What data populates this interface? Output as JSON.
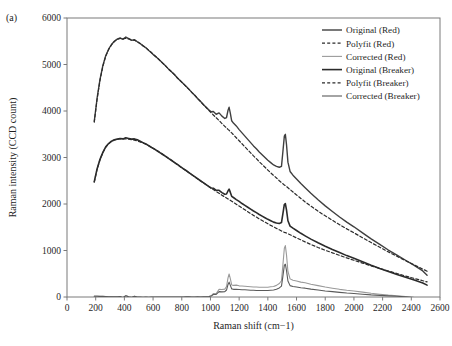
{
  "panel": {
    "label": "(a)"
  },
  "chart_data": {
    "type": "line",
    "title": "",
    "xlabel": "Raman shift (cm−1)",
    "ylabel": "Raman intensity (CCD count)",
    "xlim": [
      0,
      2600
    ],
    "ylim": [
      0,
      6000
    ],
    "xticks": [
      0,
      200,
      400,
      600,
      800,
      1000,
      1200,
      1400,
      1600,
      1800,
      2000,
      2200,
      2400,
      2600
    ],
    "yticks": [
      0,
      1000,
      2000,
      3000,
      4000,
      5000,
      6000
    ],
    "grid": false,
    "legend_position": "top-right",
    "legend": [
      {
        "label": "Original (Red)",
        "style": "solid",
        "color": "#3f3f3f",
        "width": 1.4
      },
      {
        "label": "Polyfit (Red)",
        "style": "dashed",
        "color": "#2b2b2b",
        "width": 1.2
      },
      {
        "label": "Corrected (Red)",
        "style": "solid",
        "color": "#9a9a9a",
        "width": 1.1
      },
      {
        "label": "Original (Breaker)",
        "style": "solid",
        "color": "#2b2b2b",
        "width": 1.6
      },
      {
        "label": "Polyfit (Breaker)",
        "style": "dashed",
        "color": "#2b2b2b",
        "width": 1.2
      },
      {
        "label": "Corrected (Breaker)",
        "style": "solid",
        "color": "#5a5a5a",
        "width": 1.1
      }
    ],
    "x": [
      190,
      210,
      230,
      250,
      270,
      290,
      310,
      330,
      350,
      370,
      390,
      410,
      430,
      450,
      470,
      490,
      510,
      530,
      550,
      570,
      590,
      610,
      630,
      650,
      670,
      690,
      710,
      730,
      750,
      770,
      790,
      810,
      830,
      850,
      870,
      890,
      910,
      930,
      950,
      970,
      990,
      1005,
      1020,
      1040,
      1060,
      1080,
      1100,
      1112,
      1122,
      1130,
      1138,
      1148,
      1160,
      1180,
      1200,
      1220,
      1240,
      1260,
      1280,
      1300,
      1320,
      1340,
      1360,
      1380,
      1400,
      1420,
      1440,
      1460,
      1480,
      1495,
      1505,
      1515,
      1522,
      1530,
      1540,
      1555,
      1575,
      1600,
      1630,
      1660,
      1700,
      1750,
      1800,
      1850,
      1900,
      1950,
      2000,
      2060,
      2120,
      2180,
      2240,
      2300,
      2360,
      2420,
      2480,
      2510
    ],
    "series": [
      {
        "name": "Original (Red)",
        "values": [
          3780,
          4280,
          4680,
          4980,
          5190,
          5330,
          5430,
          5500,
          5545,
          5570,
          5540,
          5590,
          5555,
          5520,
          5535,
          5490,
          5450,
          5400,
          5360,
          5300,
          5250,
          5190,
          5140,
          5080,
          5020,
          4960,
          4895,
          4840,
          4780,
          4710,
          4650,
          4590,
          4530,
          4470,
          4400,
          4340,
          4270,
          4210,
          4140,
          4080,
          4020,
          3985,
          3990,
          3930,
          3960,
          3890,
          3840,
          3860,
          4010,
          4080,
          3960,
          3790,
          3740,
          3680,
          3600,
          3530,
          3460,
          3390,
          3320,
          3250,
          3190,
          3120,
          3060,
          3000,
          2940,
          2890,
          2840,
          2810,
          2790,
          2810,
          3130,
          3460,
          3500,
          3280,
          2900,
          2700,
          2620,
          2540,
          2440,
          2350,
          2230,
          2090,
          1960,
          1840,
          1720,
          1610,
          1510,
          1380,
          1250,
          1130,
          1010,
          900,
          790,
          680,
          560,
          470
        ]
      },
      {
        "name": "Polyfit (Red)",
        "values": [
          3760,
          4260,
          4660,
          4960,
          5180,
          5320,
          5420,
          5495,
          5540,
          5560,
          5555,
          5560,
          5550,
          5530,
          5520,
          5490,
          5450,
          5405,
          5360,
          5305,
          5250,
          5195,
          5140,
          5080,
          5020,
          4960,
          4895,
          4840,
          4780,
          4710,
          4650,
          4590,
          4525,
          4465,
          4400,
          4340,
          4270,
          4205,
          4140,
          4075,
          4010,
          3960,
          3915,
          3855,
          3795,
          3730,
          3670,
          3635,
          3605,
          3585,
          3560,
          3530,
          3490,
          3425,
          3360,
          3295,
          3230,
          3165,
          3100,
          3035,
          2975,
          2910,
          2850,
          2790,
          2730,
          2670,
          2615,
          2560,
          2500,
          2460,
          2435,
          2410,
          2395,
          2375,
          2350,
          2310,
          2260,
          2195,
          2120,
          2045,
          1955,
          1845,
          1745,
          1650,
          1555,
          1465,
          1380,
          1275,
          1170,
          1070,
          970,
          875,
          780,
          690,
          600,
          555
        ]
      },
      {
        "name": "Corrected (Red)",
        "values": [
          20,
          20,
          20,
          20,
          10,
          10,
          10,
          5,
          5,
          10,
          -15,
          30,
          5,
          -10,
          15,
          0,
          0,
          -5,
          0,
          -5,
          0,
          -5,
          0,
          0,
          0,
          0,
          0,
          0,
          0,
          0,
          0,
          0,
          5,
          5,
          0,
          0,
          0,
          5,
          0,
          5,
          10,
          25,
          75,
          75,
          165,
          160,
          170,
          225,
          405,
          495,
          400,
          260,
          250,
          255,
          240,
          235,
          230,
          225,
          220,
          215,
          215,
          210,
          210,
          210,
          210,
          220,
          225,
          250,
          290,
          350,
          695,
          1050,
          1105,
          905,
          550,
          390,
          360,
          345,
          320,
          305,
          275,
          245,
          215,
          190,
          165,
          145,
          130,
          105,
          80,
          60,
          40,
          25,
          10,
          -10,
          -40,
          -85
        ]
      },
      {
        "name": "Original (Breaker)",
        "values": [
          2480,
          2760,
          2960,
          3110,
          3230,
          3300,
          3350,
          3380,
          3395,
          3410,
          3400,
          3425,
          3410,
          3395,
          3400,
          3380,
          3350,
          3320,
          3290,
          3255,
          3215,
          3180,
          3140,
          3100,
          3060,
          3020,
          2975,
          2935,
          2890,
          2850,
          2805,
          2760,
          2720,
          2675,
          2630,
          2590,
          2545,
          2500,
          2460,
          2415,
          2375,
          2345,
          2340,
          2295,
          2295,
          2245,
          2210,
          2215,
          2280,
          2320,
          2255,
          2165,
          2140,
          2095,
          2055,
          2010,
          1970,
          1930,
          1890,
          1850,
          1815,
          1775,
          1740,
          1705,
          1670,
          1640,
          1610,
          1590,
          1580,
          1600,
          1795,
          1990,
          2010,
          1875,
          1640,
          1525,
          1480,
          1430,
          1370,
          1315,
          1245,
          1165,
          1090,
          1020,
          955,
          890,
          835,
          760,
          685,
          615,
          550,
          485,
          425,
          365,
          300,
          255
        ]
      },
      {
        "name": "Polyfit (Breaker)",
        "values": [
          2470,
          2750,
          2950,
          3105,
          3220,
          3295,
          3345,
          3375,
          3390,
          3400,
          3398,
          3400,
          3395,
          3385,
          3375,
          3355,
          3335,
          3310,
          3285,
          3250,
          3215,
          3180,
          3145,
          3105,
          3065,
          3020,
          2975,
          2935,
          2890,
          2845,
          2800,
          2760,
          2715,
          2670,
          2630,
          2585,
          2540,
          2500,
          2455,
          2415,
          2370,
          2340,
          2310,
          2270,
          2230,
          2190,
          2150,
          2130,
          2110,
          2095,
          2080,
          2060,
          2035,
          1995,
          1955,
          1915,
          1875,
          1835,
          1795,
          1755,
          1720,
          1680,
          1645,
          1610,
          1575,
          1540,
          1510,
          1475,
          1445,
          1420,
          1405,
          1390,
          1385,
          1375,
          1360,
          1340,
          1310,
          1270,
          1230,
          1185,
          1130,
          1065,
          1005,
          950,
          895,
          840,
          790,
          730,
          670,
          615,
          560,
          505,
          450,
          400,
          350,
          325
        ]
      },
      {
        "name": "Corrected (Breaker)",
        "values": [
          15,
          15,
          10,
          10,
          10,
          5,
          5,
          5,
          5,
          10,
          -10,
          25,
          5,
          -5,
          15,
          0,
          0,
          -5,
          0,
          -5,
          0,
          0,
          0,
          0,
          0,
          0,
          0,
          0,
          0,
          0,
          0,
          0,
          5,
          5,
          0,
          0,
          5,
          0,
          5,
          5,
          10,
          20,
          55,
          55,
          115,
          110,
          115,
          150,
          265,
          320,
          255,
          175,
          165,
          165,
          160,
          155,
          155,
          150,
          145,
          145,
          140,
          140,
          140,
          140,
          140,
          145,
          150,
          165,
          195,
          235,
          450,
          680,
          705,
          570,
          345,
          245,
          225,
          215,
          200,
          190,
          170,
          150,
          130,
          115,
          100,
          85,
          75,
          60,
          45,
          35,
          25,
          15,
          5,
          -10,
          -30,
          -55
        ]
      }
    ]
  }
}
